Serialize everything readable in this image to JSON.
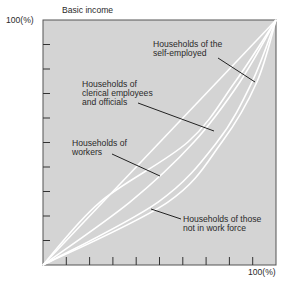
{
  "chart_data": {
    "type": "line",
    "title": "",
    "ylabel": "Basic income",
    "xlabel": "",
    "y_max_label": "100(%)",
    "x_max_label": "100(%)",
    "xlim": [
      0,
      100
    ],
    "ylim": [
      0,
      100
    ],
    "grid": false,
    "x_ticks": [
      10,
      20,
      30,
      40,
      50,
      60,
      70,
      80,
      90
    ],
    "y_ticks": [
      10,
      20,
      30,
      40,
      50,
      60,
      70,
      80,
      90
    ],
    "background_color": "#d4d4d4",
    "line_color": "#ffffff",
    "equality_line": {
      "x": [
        0,
        100
      ],
      "y": [
        0,
        100
      ]
    },
    "series": [
      {
        "name": "Households of workers",
        "x": [
          0,
          24.5,
          62.2,
          82.4,
          100
        ],
        "y": [
          0,
          25.7,
          50.2,
          74.7,
          100
        ]
      },
      {
        "name": "Households of clerical employees and officials",
        "x": [
          0,
          37.3,
          64.8,
          84.5,
          100
        ],
        "y": [
          0,
          25.7,
          50.2,
          74.7,
          100
        ]
      },
      {
        "name": "Households of the self-employed",
        "x": [
          0,
          49.4,
          74.7,
          89.7,
          100
        ],
        "y": [
          0,
          25.7,
          50.2,
          74.7,
          100
        ]
      },
      {
        "name": "Households of those not in work force",
        "x": [
          0,
          53.6,
          76.8,
          91.8,
          100
        ],
        "y": [
          0,
          25.7,
          50.2,
          74.7,
          100
        ]
      }
    ],
    "annotations": [
      {
        "lines": [
          "Households of the",
          "self-employed"
        ]
      },
      {
        "lines": [
          "Households of",
          "clerical employees",
          "and officials"
        ]
      },
      {
        "lines": [
          "Households of",
          "workers"
        ]
      },
      {
        "lines": [
          "Households of those",
          "not in work force"
        ]
      }
    ]
  }
}
